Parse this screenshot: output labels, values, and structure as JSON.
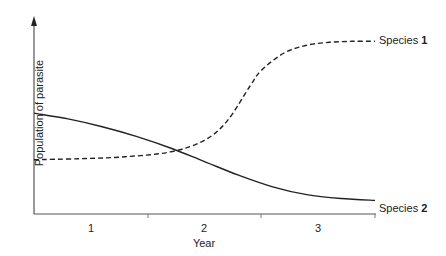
{
  "chart_data": {
    "type": "line",
    "title": "",
    "xlabel": "Year",
    "ylabel": "Population of parasite",
    "x_ticks": [
      "1",
      "2",
      "3"
    ],
    "x_tick_boundaries": [
      0,
      1,
      2,
      3
    ],
    "xlim": [
      0,
      3
    ],
    "ylim": [
      0,
      1
    ],
    "grid": false,
    "legend_position": "inline-right",
    "series": [
      {
        "name": "Species 1",
        "name_prefix": "Species ",
        "name_bold": "1",
        "style": "dashed",
        "color": "#222222",
        "x": [
          0,
          0.4,
          0.8,
          1.2,
          1.5,
          1.7,
          1.9,
          2.0,
          2.2,
          2.4,
          2.6,
          2.8,
          3.0
        ],
        "y": [
          0.28,
          0.285,
          0.295,
          0.32,
          0.38,
          0.48,
          0.66,
          0.74,
          0.83,
          0.87,
          0.885,
          0.89,
          0.89
        ]
      },
      {
        "name": "Species 2",
        "name_prefix": "Species ",
        "name_bold": "2",
        "style": "solid",
        "color": "#222222",
        "x": [
          0,
          0.3,
          0.6,
          0.9,
          1.2,
          1.5,
          1.8,
          2.1,
          2.4,
          2.7,
          3.0
        ],
        "y": [
          0.52,
          0.49,
          0.45,
          0.4,
          0.34,
          0.27,
          0.2,
          0.14,
          0.1,
          0.08,
          0.07
        ]
      }
    ]
  },
  "labels": {
    "species1_prefix": "Species ",
    "species1_bold": "1",
    "species2_prefix": "Species ",
    "species2_bold": "2",
    "year": "Year",
    "ylabel": "Population of parasite",
    "tick1": "1",
    "tick2": "2",
    "tick3": "3"
  }
}
